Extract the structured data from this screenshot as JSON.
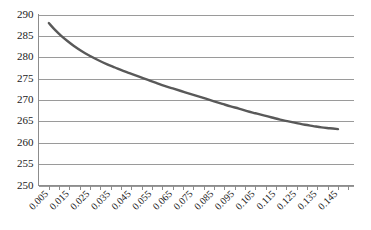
{
  "chart_data": {
    "type": "line",
    "title": "",
    "subtitle": "",
    "xlabel": "",
    "ylabel": "",
    "xlim": [
      0.0,
      0.1525
    ],
    "ylim": [
      250,
      290
    ],
    "grid": true,
    "grid_axis": "y",
    "legend": false,
    "legend_position": "none",
    "line_color": "#595959",
    "gridline_color": "#9a9a9a",
    "axis_color": "#8c8c8c",
    "background_color": "#ffffff",
    "y_ticks": [
      250,
      255,
      260,
      265,
      270,
      275,
      280,
      285,
      290
    ],
    "y_tick_labels": [
      "250",
      "255",
      "260",
      "265",
      "270",
      "275",
      "280",
      "285",
      "290"
    ],
    "x_tick_labels": [
      "0.005",
      "0.015",
      "0.025",
      "0.035",
      "0.045",
      "0.055",
      "0.065",
      "0.075",
      "0.085",
      "0.095",
      "0.105",
      "0.115",
      "0.125",
      "0.135",
      "0.145"
    ],
    "x_tick_values": [
      0.005,
      0.015,
      0.025,
      0.035,
      0.045,
      0.055,
      0.065,
      0.075,
      0.085,
      0.095,
      0.105,
      0.115,
      0.125,
      0.135,
      0.145
    ],
    "x_minor_tick_values": [
      0.005,
      0.01,
      0.015,
      0.02,
      0.025,
      0.03,
      0.035,
      0.04,
      0.045,
      0.05,
      0.055,
      0.06,
      0.065,
      0.07,
      0.075,
      0.08,
      0.085,
      0.09,
      0.095,
      0.1,
      0.105,
      0.11,
      0.115,
      0.12,
      0.125,
      0.13,
      0.135,
      0.14,
      0.145,
      0.15
    ],
    "x": [
      0.005,
      0.008,
      0.011,
      0.014,
      0.017,
      0.021,
      0.025,
      0.029,
      0.033,
      0.037,
      0.041,
      0.045,
      0.049,
      0.053,
      0.057,
      0.061,
      0.065,
      0.069,
      0.073,
      0.077,
      0.081,
      0.085,
      0.089,
      0.093,
      0.097,
      0.101,
      0.105,
      0.109,
      0.113,
      0.117,
      0.121,
      0.125,
      0.129,
      0.133,
      0.137,
      0.141,
      0.145
    ],
    "y": [
      288.0,
      286.4,
      285.0,
      283.8,
      282.7,
      281.4,
      280.3,
      279.3,
      278.4,
      277.6,
      276.8,
      276.1,
      275.4,
      274.7,
      274.0,
      273.3,
      272.7,
      272.1,
      271.5,
      270.9,
      270.3,
      269.7,
      269.1,
      268.5,
      268.0,
      267.4,
      266.9,
      266.4,
      265.9,
      265.4,
      265.0,
      264.6,
      264.2,
      263.9,
      263.6,
      263.4,
      263.2
    ],
    "series": [
      {
        "name": "series-1",
        "color": "#595959",
        "values": [
          288.0,
          286.4,
          285.0,
          283.8,
          282.7,
          281.4,
          280.3,
          279.3,
          278.4,
          277.6,
          276.8,
          276.1,
          275.4,
          274.7,
          274.0,
          273.3,
          272.7,
          272.1,
          271.5,
          270.9,
          270.3,
          269.7,
          269.1,
          268.5,
          268.0,
          267.4,
          266.9,
          266.4,
          265.9,
          265.4,
          265.0,
          264.6,
          264.2,
          263.9,
          263.6,
          263.4,
          263.2
        ]
      }
    ]
  }
}
